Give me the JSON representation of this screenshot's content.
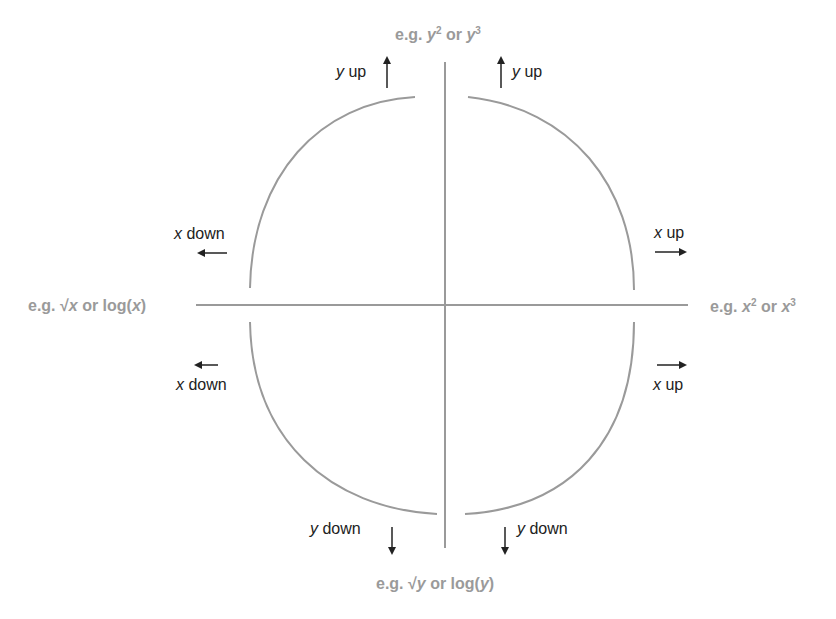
{
  "diagram": {
    "colors": {
      "axis": "#9a9a9a",
      "arc": "#9a9a9a",
      "arrow": "#222222",
      "label": "#222222",
      "axis_label": "#9a9a9a"
    },
    "axis_labels": {
      "top": {
        "prefix": "e.g. ",
        "var1": "y",
        "exp1": "2",
        "mid": " or ",
        "var2": "y",
        "exp2": "3"
      },
      "bottom": {
        "prefix": "e.g. √",
        "var1": "y",
        "mid": " or log(",
        "var2": "y",
        "suffix": ")"
      },
      "left": {
        "prefix": "e.g. √",
        "var1": "x",
        "mid": " or log(",
        "var2": "x",
        "suffix": ")"
      },
      "right": {
        "prefix": "e.g. ",
        "var1": "x",
        "exp1": "2",
        "mid": " or ",
        "var2": "x",
        "exp2": "3"
      }
    },
    "quadrant_labels": {
      "top_left_y": {
        "var": "y",
        "text": " up",
        "arrow": "up-arrow"
      },
      "top_right_y": {
        "var": "y",
        "text": " up",
        "arrow": "up-arrow"
      },
      "top_left_x": {
        "var": "x",
        "text": " down",
        "arrow": "left-arrow"
      },
      "top_right_x": {
        "var": "x",
        "text": " up",
        "arrow": "right-arrow"
      },
      "bottom_left_x": {
        "var": "x",
        "text": " down",
        "arrow": "left-arrow"
      },
      "bottom_right_x": {
        "var": "x",
        "text": " up",
        "arrow": "right-arrow"
      },
      "bottom_left_y": {
        "var": "y",
        "text": " down",
        "arrow": "down-arrow"
      },
      "bottom_right_y": {
        "var": "y",
        "text": " down",
        "arrow": "down-arrow"
      }
    }
  }
}
